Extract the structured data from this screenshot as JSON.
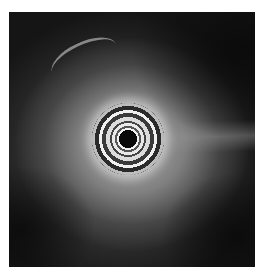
{
  "image": {
    "description": "Grayscale radial ultrasound scan with concentric transducer rings at center",
    "background_color": "#ffffff",
    "frame": {
      "x": 9,
      "y": 12,
      "width": 246,
      "height": 255
    },
    "center": {
      "x": 134,
      "y": 143
    },
    "colors": {
      "dark_field": "#151515",
      "tissue": "#a0a0a0",
      "ring_bright": "#f2f2f2",
      "lumen": "#0a0a0a"
    }
  }
}
